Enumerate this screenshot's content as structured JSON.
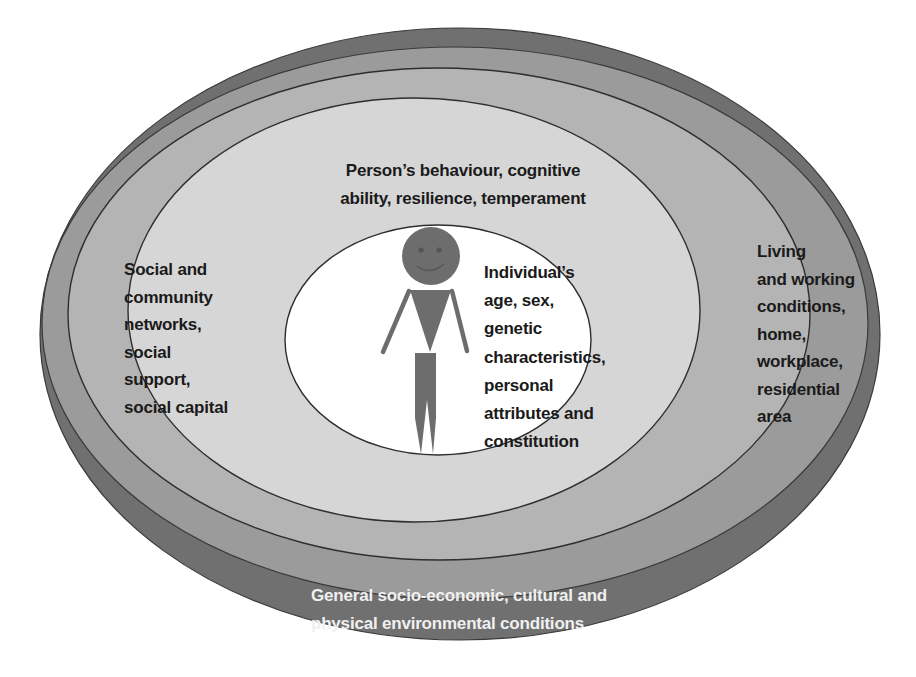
{
  "diagram": {
    "colors": {
      "outer_environment": "#707070",
      "living_working": "#9b9b9b",
      "social_networks": "#b4b4b4",
      "behaviour": "#d6d6d6",
      "individual": "#ffffff",
      "figure": "#6d6d6d",
      "stroke": "#3a3a3a"
    },
    "layers": [
      {
        "id": "individual",
        "lines": [
          "Individual’s",
          "age, sex,",
          "genetic",
          "characteristics,",
          "personal",
          "attributes and",
          "constitution"
        ]
      },
      {
        "id": "behaviour",
        "lines": [
          "Person’s behaviour, cognitive",
          "ability, resilience,  temperament"
        ]
      },
      {
        "id": "social_networks",
        "lines": [
          "Social and",
          "community",
          "networks,",
          "social",
          "support,",
          "social capital"
        ]
      },
      {
        "id": "living_working",
        "lines": [
          "Living",
          "and working",
          "conditions,",
          "home,",
          "workplace,",
          "residential",
          "area"
        ]
      },
      {
        "id": "outer_environment",
        "lines": [
          "General socio-economic, cultural and",
          "physical environmental conditions"
        ]
      }
    ]
  }
}
